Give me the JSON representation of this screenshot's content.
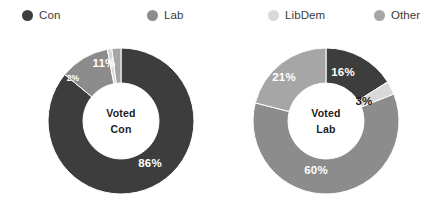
{
  "legend": {
    "items": [
      {
        "label": "Con",
        "color": "#3d3d3d",
        "x": 22
      },
      {
        "label": "Lab",
        "color": "#8c8c8c",
        "x": 147
      },
      {
        "label": "LibDem",
        "color": "#d9d9d9",
        "x": 268
      },
      {
        "label": "Other",
        "color": "#a6a6a6",
        "x": 374
      }
    ]
  },
  "chart_data": [
    {
      "type": "pie",
      "title": "Voted Con",
      "center_lines": [
        "Voted",
        "Con"
      ],
      "categories": [
        "Con",
        "Lab",
        "LibDem",
        "Other"
      ],
      "values": [
        86,
        11,
        1,
        2
      ],
      "colors": [
        "#3d3d3d",
        "#8c8c8c",
        "#d9d9d9",
        "#a6a6a6"
      ],
      "labels": [
        {
          "text": "86%",
          "value": 86,
          "tone": "light",
          "size": "normal",
          "x": 150,
          "y": 163
        },
        {
          "text": "11%",
          "value": 11,
          "tone": "light",
          "size": "normal",
          "x": 104,
          "y": 63
        },
        {
          "text": "2%",
          "value": 2,
          "tone": "light",
          "size": "tiny",
          "x": 73,
          "y": 78
        }
      ],
      "legend_position": "top",
      "grid": false,
      "donut_hole_ratio": 0.52
    },
    {
      "type": "pie",
      "title": "Voted Lab",
      "center_lines": [
        "Voted",
        "Lab"
      ],
      "categories": [
        "Con",
        "LibDem",
        "Lab",
        "Other"
      ],
      "values": [
        16,
        3,
        60,
        21
      ],
      "colors": [
        "#3d3d3d",
        "#d9d9d9",
        "#8c8c8c",
        "#a6a6a6"
      ],
      "labels": [
        {
          "text": "16%",
          "value": 16,
          "tone": "light",
          "size": "normal",
          "x": 343,
          "y": 72
        },
        {
          "text": "3%",
          "value": 3,
          "tone": "dark",
          "size": "normal",
          "x": 364,
          "y": 101
        },
        {
          "text": "60%",
          "value": 60,
          "tone": "light",
          "size": "normal",
          "x": 316,
          "y": 170
        },
        {
          "text": "21%",
          "value": 21,
          "tone": "light",
          "size": "normal",
          "x": 284,
          "y": 77
        }
      ],
      "legend_position": "top",
      "grid": false,
      "donut_hole_ratio": 0.52
    }
  ],
  "geometry": {
    "charts": [
      {
        "left": 48,
        "top": 48,
        "size": 146
      },
      {
        "left": 253,
        "top": 48,
        "size": 146
      }
    ]
  }
}
